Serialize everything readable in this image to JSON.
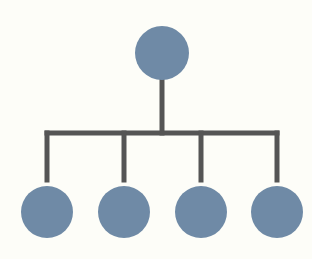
{
  "diagram": {
    "type": "hierarchy",
    "colors": {
      "background": "#fdfdf8",
      "node": "#6f8aa6",
      "connector": "#555555"
    },
    "root": {
      "cx": 162,
      "cy": 53,
      "r": 27
    },
    "trunk": {
      "x": 162,
      "y1": 80,
      "y2": 133
    },
    "bar": {
      "x1": 47,
      "x2": 277,
      "y": 133
    },
    "children": [
      {
        "cx": 47,
        "cy": 212,
        "r": 26
      },
      {
        "cx": 124,
        "cy": 212,
        "r": 26
      },
      {
        "cx": 201,
        "cy": 212,
        "r": 26
      },
      {
        "cx": 277,
        "cy": 212,
        "r": 26
      }
    ],
    "drop_y2": 180
  }
}
